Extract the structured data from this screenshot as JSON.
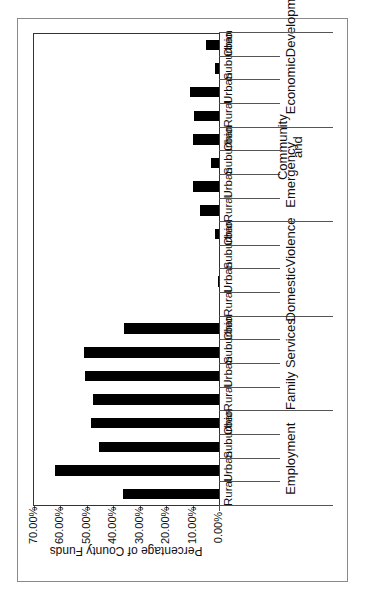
{
  "chart_data": {
    "type": "bar",
    "orientation_on_page": "rotated 90 degrees counter-clockwise",
    "title": "",
    "xlabel": "",
    "ylabel": "Percentage of County Funds",
    "ylim": [
      0,
      70
    ],
    "yticks": [
      "0.00%",
      "10.00%",
      "20.00%",
      "30.00%",
      "40.00%",
      "50.00%",
      "60.00%",
      "70.00%"
    ],
    "grid": false,
    "legend": null,
    "groups": [
      "Employment",
      "Family Services",
      "Domestic Violence",
      "Emergency",
      "Community and Economic Development"
    ],
    "subcategories": [
      "Rural",
      "Urban",
      "Suburban",
      "Ohio"
    ],
    "categories": [
      "Employment - Rural",
      "Employment - Urban",
      "Employment - Suburban",
      "Employment - Ohio",
      "Family Services - Rural",
      "Family Services - Urban",
      "Family Services - Suburban",
      "Family Services - Ohio",
      "Domestic Violence - Rural",
      "Domestic Violence - Urban",
      "Domestic Violence - Suburban",
      "Domestic Violence - Ohio",
      "Emergency - Rural",
      "Emergency - Urban",
      "Emergency - Suburban",
      "Emergency - Ohio",
      "Community and Economic Development - Rural",
      "Community and Economic Development - Urban",
      "Community and Economic Development - Suburban",
      "Community and Economic Development - Ohio"
    ],
    "values": [
      36.2,
      61.9,
      45.3,
      48.5,
      47.5,
      50.6,
      50.9,
      36.0,
      0.0,
      0.3,
      0.0,
      1.4,
      7.3,
      10.0,
      2.9,
      10.0,
      9.4,
      10.8,
      1.6,
      5.1
    ],
    "unit": "%"
  },
  "axis": {
    "title": "Percentage of County Funds",
    "ticks": [
      "0.00%",
      "10.00%",
      "20.00%",
      "30.00%",
      "40.00%",
      "50.00%",
      "60.00%",
      "70.00%"
    ]
  },
  "group_labels": [
    [
      "Employment"
    ],
    [
      "Family Services"
    ],
    [
      "Domestic",
      "Violence"
    ],
    [
      "Emergency"
    ],
    [
      "Community and",
      "Economic",
      "Development"
    ]
  ],
  "sub_labels": [
    "Rural",
    "Urban",
    "Suburban",
    "Ohio"
  ],
  "colors": {
    "bar": "#000000",
    "frame": "#8a8a8a",
    "axis": "#333333"
  }
}
